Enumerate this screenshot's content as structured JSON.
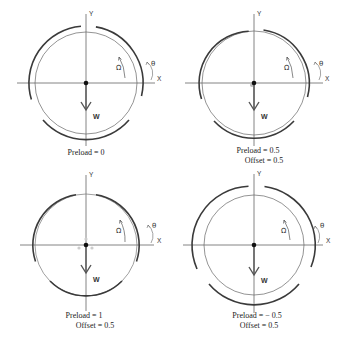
{
  "figure": {
    "panels": [
      {
        "id": "p1",
        "axis_x_label": "X",
        "axis_y_label": "Y",
        "theta_label": "θ",
        "omega_label": "Ω",
        "load_label": "W",
        "preload_label": "Preload = 0",
        "offset_label": ""
      },
      {
        "id": "p2",
        "axis_x_label": "X",
        "axis_y_label": "Y",
        "theta_label": "θ",
        "omega_label": "Ω",
        "load_label": "W",
        "preload_label": "Preload = 0.5",
        "offset_label": "Offset = 0.5"
      },
      {
        "id": "p3",
        "axis_x_label": "X",
        "axis_y_label": "Y",
        "theta_label": "θ",
        "omega_label": "Ω",
        "load_label": "W",
        "preload_label": "Preload = 1",
        "offset_label": "Offset = 0.5"
      },
      {
        "id": "p4",
        "axis_x_label": "X",
        "axis_y_label": "Y",
        "theta_label": "θ",
        "omega_label": "Ω",
        "load_label": "W",
        "preload_label": "Preload = − 0.5",
        "offset_label": "Offset = 0.5"
      }
    ],
    "colors": {
      "pad": "#3a3a3a",
      "journal": "#555555",
      "axis": "#666666",
      "arrow": "#555555",
      "center_dot": "#111111",
      "marker": "#bbbbbb"
    }
  }
}
